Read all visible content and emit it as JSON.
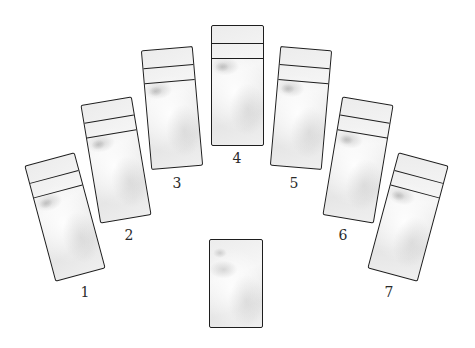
{
  "diagram": {
    "type": "card-spread-layout",
    "colors": {
      "background": "#ffffff",
      "card_outline": "#1e1e1e",
      "card_fill": "#efefef",
      "label_text": "#2a2a2a"
    },
    "positions": [
      {
        "label": "1",
        "center": [
          65,
          217
        ],
        "rotation_deg": -15
      },
      {
        "label": "2",
        "center": [
          116,
          160
        ],
        "rotation_deg": -9.5
      },
      {
        "label": "3",
        "center": [
          172,
          108
        ],
        "rotation_deg": -5
      },
      {
        "label": "4",
        "center": [
          237,
          85
        ],
        "rotation_deg": 0
      },
      {
        "label": "5",
        "center": [
          301,
          108
        ],
        "rotation_deg": 5
      },
      {
        "label": "6",
        "center": [
          358,
          160
        ],
        "rotation_deg": 9.5
      },
      {
        "label": "7",
        "center": [
          408,
          217
        ],
        "rotation_deg": 15
      }
    ],
    "bottom_card": {
      "label": "",
      "center": [
        236,
        283
      ],
      "rotation_deg": 0
    },
    "stacked_layers_per_position": 3
  }
}
